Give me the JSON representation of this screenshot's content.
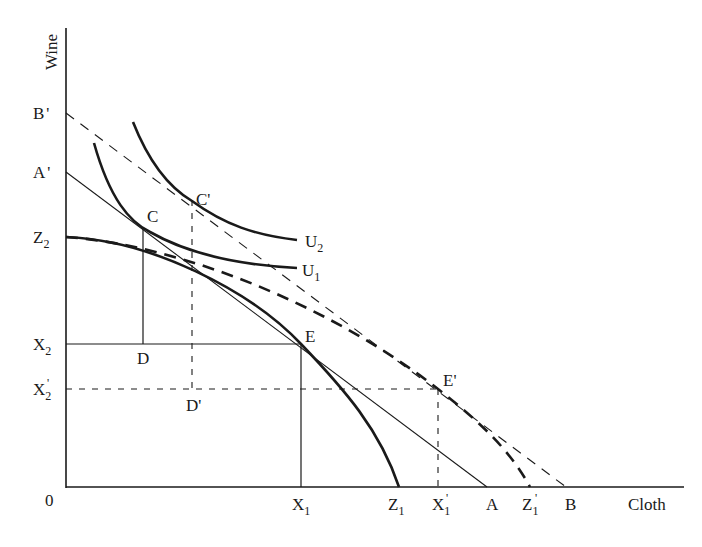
{
  "diagram": {
    "type": "trade-gains-production-possibility",
    "axes": {
      "x_label": "Cloth",
      "y_label": "Wine",
      "origin_label": "0"
    },
    "y_axis_labels": [
      {
        "id": "B'",
        "text": "B",
        "prime": "'",
        "sub": ""
      },
      {
        "id": "A'",
        "text": "A",
        "prime": "'",
        "sub": ""
      },
      {
        "id": "Z2",
        "text": "Z",
        "prime": "",
        "sub": "2"
      },
      {
        "id": "X2",
        "text": "X",
        "prime": "",
        "sub": "2"
      },
      {
        "id": "X2'",
        "text": "X",
        "prime": "'",
        "sub": "2"
      }
    ],
    "x_axis_labels": [
      {
        "id": "X1",
        "text": "X",
        "prime": "",
        "sub": "1"
      },
      {
        "id": "Z1",
        "text": "Z",
        "prime": "",
        "sub": "1"
      },
      {
        "id": "X1'",
        "text": "X",
        "prime": "'",
        "sub": "1"
      },
      {
        "id": "A",
        "text": "A",
        "prime": "",
        "sub": ""
      },
      {
        "id": "Z1'",
        "text": "Z",
        "prime": "'",
        "sub": "1"
      },
      {
        "id": "B",
        "text": "B",
        "prime": "",
        "sub": ""
      }
    ],
    "points": {
      "C": "C",
      "C_prime": "C'",
      "D": "D",
      "D_prime": "D'",
      "E": "E",
      "E_prime": "E'"
    },
    "curves": {
      "U1": {
        "text": "U",
        "sub": "1"
      },
      "U2": {
        "text": "U",
        "sub": "2"
      }
    },
    "lines": [
      {
        "name": "price-line-AA'",
        "from": "A'",
        "to": "A",
        "style": "solid-thin"
      },
      {
        "name": "price-line-BB'",
        "from": "B'",
        "to": "B",
        "style": "dashed-thin"
      },
      {
        "name": "ppf-Z1Z2",
        "from": "Z2",
        "to": "Z1",
        "style": "solid-thick"
      },
      {
        "name": "ppf-Z1'Z2",
        "from": "Z2",
        "to": "Z1'",
        "style": "dashed-thick"
      },
      {
        "name": "indifference-U1",
        "style": "solid-thick"
      },
      {
        "name": "indifference-U2",
        "style": "solid-thick"
      }
    ],
    "colors": {
      "ink": "#1a1a1a",
      "background": "#ffffff"
    }
  }
}
